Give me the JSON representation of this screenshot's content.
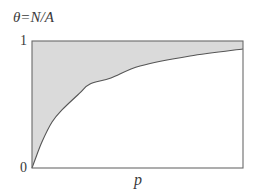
{
  "chart_data": {
    "type": "area",
    "title": "θ=N/A",
    "xlabel": "p",
    "ylabel": "θ=N/A",
    "yticks": [
      "0",
      "1"
    ],
    "ylim": [
      0,
      1
    ],
    "xlim": [
      0,
      1
    ],
    "grid": false,
    "legend": null,
    "shaded_region": "between curve and θ=1",
    "series": [
      {
        "name": "θ(p)",
        "x": [
          0.0,
          0.014,
          0.047,
          0.095,
          0.142,
          0.227,
          0.275,
          0.374,
          0.512,
          0.749,
          1.0
        ],
        "values": [
          0.0,
          0.063,
          0.205,
          0.362,
          0.457,
          0.591,
          0.661,
          0.709,
          0.803,
          0.882,
          0.937
        ]
      }
    ],
    "colors": {
      "fill": "#dadada",
      "line": "#555555",
      "frame": "#6a6a6a"
    }
  },
  "labels": {
    "title": "θ=N/A",
    "y_max_tick": "1",
    "y_min_tick": "0",
    "x_axis": "p"
  },
  "plot_box": {
    "left": 32,
    "top": 41,
    "right": 243,
    "bottom": 168
  }
}
